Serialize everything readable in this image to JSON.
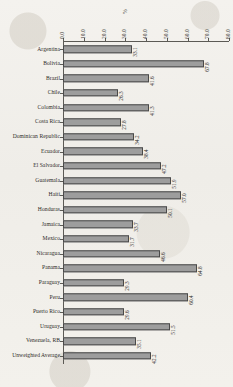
{
  "chart_data": {
    "type": "bar",
    "orientation": "horizontal",
    "title": "",
    "xlabel": "%",
    "ylabel": "",
    "xlim": [
      0,
      80
    ],
    "grid": false,
    "legend": null,
    "axis_position": "top",
    "tick_labels": [
      "0.0",
      "10.0",
      "20.0",
      "30.0",
      "40.0",
      "50.0",
      "60.0",
      "70.0",
      "80.0"
    ],
    "tick_values": [
      0,
      10,
      20,
      30,
      40,
      50,
      60,
      70,
      80
    ],
    "categories": [
      "Argentina",
      "Bolivia",
      "Brazil",
      "Chile",
      "Colombia",
      "Costa Rica",
      "Dominican Republic",
      "Ecuador",
      "El Salvador",
      "Guatemala",
      "Haiti",
      "Honduras",
      "Jamaica",
      "Mexico",
      "Nicaragua",
      "Panama",
      "Paraguay",
      "Peru",
      "Puerto Rico",
      "Uruguay",
      "Venezuela, RB",
      "Unweighted Average"
    ],
    "values": [
      33.1,
      67.8,
      41.6,
      26.3,
      41.3,
      27.8,
      34.2,
      38.4,
      47.2,
      51.9,
      57.0,
      50.1,
      33.7,
      31.7,
      46.6,
      64.8,
      29.3,
      60.4,
      29.6,
      51.5,
      35.1,
      42.2
    ],
    "data_labels": [
      "33.1",
      "67.8",
      "41.6",
      "26.3",
      "41.3",
      "27.8",
      "34.2",
      "38.4",
      "47.2",
      "51.9",
      "57.0",
      "50.1",
      "33.7",
      "31.7",
      "46.6",
      "64.8",
      "29.3",
      "60.4",
      "29.6",
      "51.5",
      "35.1",
      "42.2"
    ],
    "colors": {
      "bar_fill": "#9d9d9d",
      "bar_edge": "#4a4a4a",
      "axis": "#5c5a55",
      "text": "#2e2c28",
      "background": "#f2f0ec"
    }
  }
}
